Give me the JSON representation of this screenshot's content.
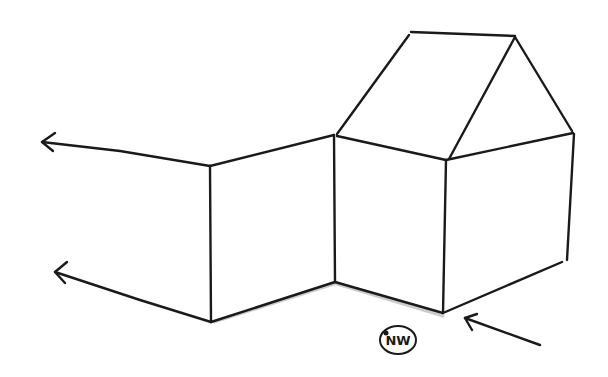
{
  "diagram": {
    "type": "hand-drawn sketch",
    "stroke_color": "#1a1a1a",
    "background": "#ffffff",
    "labels": {
      "direction": "NW"
    },
    "elements": [
      {
        "name": "adjoining-wall",
        "description": "wall section extending left from house, with two arrows continuing leftward"
      },
      {
        "name": "house",
        "description": "box-shaped house body with gabled roof"
      },
      {
        "name": "direction-arrow",
        "description": "arrow pointing at the house front corner from lower right"
      },
      {
        "name": "direction-label",
        "description": "circled NW label"
      }
    ]
  }
}
